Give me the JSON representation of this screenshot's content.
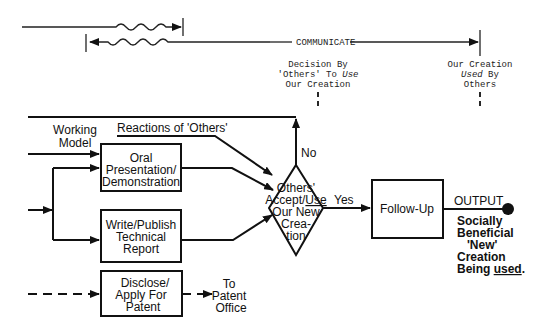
{
  "top": {
    "communicate_label": "COMMUNICATE",
    "decision_note": {
      "line1": "Decision By",
      "line2_a": "'Others' To ",
      "line2_b": "Use",
      "line3": "Our Creation"
    },
    "used_note": {
      "line1": "Our Creation",
      "line2_a": "Used",
      "line2_b": " By",
      "line3": "Others"
    }
  },
  "inputs": {
    "working_model": [
      "Working",
      "Model"
    ],
    "reactions": "Reactions of 'Others'"
  },
  "boxes": {
    "oral": [
      "Oral",
      "Presentation/",
      "Demonstration"
    ],
    "write": [
      "Write/Publish",
      "Technical",
      "Report"
    ],
    "disclose": [
      "Disclose/",
      "Apply For",
      "Patent"
    ],
    "follow_up": "Follow-Up"
  },
  "decision": {
    "lines": [
      "Others'",
      "Accept/",
      "Use",
      "Our New",
      "Crea-",
      "tion"
    ],
    "no_label": "No",
    "yes_label": "Yes"
  },
  "patent_target": [
    "To",
    "Patent",
    "Office"
  ],
  "output": {
    "label": "OUTPUT",
    "desc": [
      "Socially",
      "Beneficial",
      "'New'",
      "Creation",
      "Being "
    ],
    "desc_underlined": "used",
    "desc_end": "."
  }
}
